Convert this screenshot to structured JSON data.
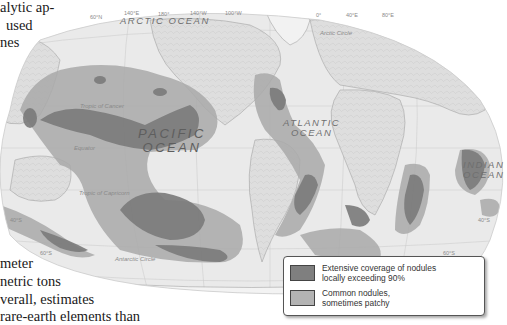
{
  "body_text": {
    "lines_top": [
      "alytic ap-",
      "used",
      "nes"
    ],
    "lines_bottom": [
      "meter",
      "netric  tons",
      "verall,  estimates",
      "rare-earth elements than"
    ]
  },
  "map": {
    "oceans": {
      "arctic": "ARCTIC OCEAN",
      "pacific_line1": "PACIFIC",
      "pacific_line2": "OCEAN",
      "atlantic_line1": "ATLANTIC",
      "atlantic_line2": "OCEAN",
      "indian_line1": "INDIAN",
      "indian_line2": "OCEAN"
    },
    "lines": {
      "arctic_circle": "Arctic Circle",
      "tropic_cancer": "Tropic of Cancer",
      "equator": "Equator",
      "tropic_capricorn": "Tropic of Capricorn",
      "antarctic_circle": "Antarctic Circle"
    },
    "grid_labels": {
      "lat_60n": "60°N",
      "lon_180": "180°",
      "lon_140e": "140°E",
      "lon_140w": "140°W",
      "lon_100w": "100°W",
      "lon_0": "0°",
      "lon_40e": "40°E",
      "lon_80e": "80°E",
      "lat_40s_left": "40°S",
      "lat_60s_left": "60°S",
      "lat_40s_right": "40°S",
      "lat_60s_right": "60°S"
    },
    "colors": {
      "land": "#dcdcdc",
      "ocean": "#ececec",
      "extensive": "#7d7d7d",
      "common": "#a8a8a8"
    }
  },
  "legend": {
    "items": [
      {
        "label": "Extensive coverage of nodules locally exceeding 90%",
        "color": "#7f7f7f"
      },
      {
        "label": "Common nodules, sometimes patchy",
        "color": "#b3b3b3"
      }
    ],
    "item0_line1": "Extensive coverage of nodules",
    "item0_line2": "locally exceeding 90%",
    "item1_line1": "Common nodules,",
    "item1_line2": "sometimes patchy"
  }
}
